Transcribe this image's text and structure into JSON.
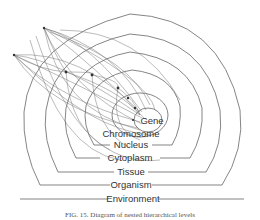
{
  "diagram": {
    "levels": [
      {
        "label": "Gene"
      },
      {
        "label": "Chromosome"
      },
      {
        "label": "Nucleus"
      },
      {
        "label": "Cytoplasm"
      },
      {
        "label": "Tissue"
      },
      {
        "label": "Organism"
      },
      {
        "label": "Environment"
      }
    ],
    "caption": "FIG. 15. Diagram of nested hierarchical levels",
    "line_color": "#555555",
    "background": "#ffffff"
  }
}
